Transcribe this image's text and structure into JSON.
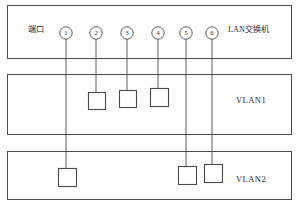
{
  "diagram": {
    "stroke_color": "#4a4a4a",
    "text_color": "#2e2e2e",
    "background_color": "#fdfdfc",
    "switch": {
      "name": "lan-switch",
      "label": "LAN交换机",
      "label_x": 228,
      "label_y": 27,
      "port_title": "端口",
      "port_title_x": 28,
      "port_title_y": 27,
      "box": {
        "x": 7,
        "y": 5,
        "w": 284,
        "h": 53
      }
    },
    "ports": [
      {
        "id": "port-1",
        "number": "①",
        "plain": "1",
        "cx": 66,
        "cy": 33,
        "r": 6.2,
        "connects_to": "vlan2"
      },
      {
        "id": "port-2",
        "number": "②",
        "plain": "2",
        "cx": 96,
        "cy": 33,
        "r": 6.2,
        "connects_to": "vlan1"
      },
      {
        "id": "port-3",
        "number": "③",
        "plain": "3",
        "cx": 127,
        "cy": 33,
        "r": 6.2,
        "connects_to": "vlan1"
      },
      {
        "id": "port-4",
        "number": "④",
        "plain": "4",
        "cx": 158,
        "cy": 33,
        "r": 6.2,
        "connects_to": "vlan1"
      },
      {
        "id": "port-5",
        "number": "⑤",
        "plain": "5",
        "cx": 186,
        "cy": 33,
        "r": 6.2,
        "connects_to": "vlan2"
      },
      {
        "id": "port-6",
        "number": "⑥",
        "plain": "6",
        "cx": 212,
        "cy": 33,
        "r": 6.2,
        "connects_to": "vlan2"
      }
    ],
    "vlans": [
      {
        "id": "vlan1",
        "label": "VLAN1",
        "label_x": 236,
        "label_y": 100,
        "box": {
          "x": 7,
          "y": 74,
          "w": 284,
          "h": 60
        },
        "hosts": [
          {
            "id": "vlan1-host-2",
            "port": "2",
            "x": 88,
            "y": 92,
            "w": 17,
            "h": 17
          },
          {
            "id": "vlan1-host-3",
            "port": "3",
            "x": 119,
            "y": 90,
            "w": 17,
            "h": 17
          },
          {
            "id": "vlan1-host-4",
            "port": "4",
            "x": 150,
            "y": 88,
            "w": 18,
            "h": 18
          }
        ]
      },
      {
        "id": "vlan2",
        "label": "VLAN2",
        "label_x": 236,
        "label_y": 179,
        "box": {
          "x": 7,
          "y": 151,
          "w": 284,
          "h": 48
        },
        "hosts": [
          {
            "id": "vlan2-host-1",
            "port": "1",
            "x": 58,
            "y": 168,
            "w": 18,
            "h": 18
          },
          {
            "id": "vlan2-host-5",
            "port": "5",
            "x": 178,
            "y": 166,
            "w": 18,
            "h": 18
          },
          {
            "id": "vlan2-host-6",
            "port": "6",
            "x": 204,
            "y": 164,
            "w": 18,
            "h": 18
          }
        ]
      }
    ],
    "connections": [
      {
        "id": "link-port-1",
        "from": "port-1",
        "x": 66,
        "y1": 39,
        "y2": 168
      },
      {
        "id": "link-port-2",
        "from": "port-2",
        "x": 96,
        "y1": 39,
        "y2": 92
      },
      {
        "id": "link-port-3",
        "from": "port-3",
        "x": 127,
        "y1": 39,
        "y2": 90
      },
      {
        "id": "link-port-4",
        "from": "port-4",
        "x": 158,
        "y1": 39,
        "y2": 88
      },
      {
        "id": "link-port-5",
        "from": "port-5",
        "x": 186,
        "y1": 39,
        "y2": 166
      },
      {
        "id": "link-port-6",
        "from": "port-6",
        "x": 212,
        "y1": 39,
        "y2": 164
      }
    ]
  }
}
